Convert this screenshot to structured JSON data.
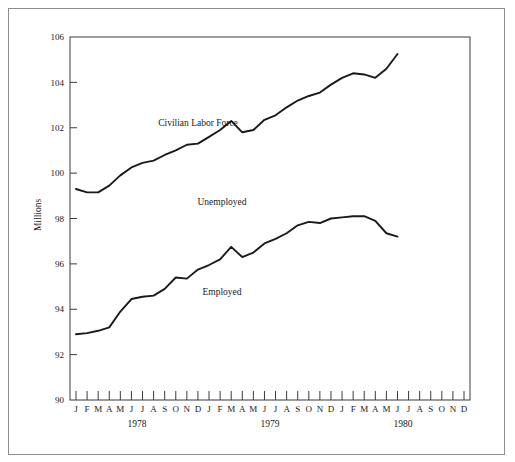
{
  "chart_data": {
    "type": "line",
    "title": "",
    "xlabel": "",
    "ylabel": "Millions",
    "ylim": [
      90,
      106
    ],
    "yticks": [
      90,
      92,
      94,
      96,
      98,
      100,
      102,
      104,
      106
    ],
    "grid": false,
    "legend_position": "inline-annotations",
    "x": [
      "J",
      "F",
      "M",
      "A",
      "M",
      "J",
      "J",
      "A",
      "S",
      "O",
      "N",
      "D",
      "J",
      "F",
      "M",
      "A",
      "M",
      "J",
      "J",
      "A",
      "S",
      "O",
      "N",
      "D",
      "J",
      "F",
      "M",
      "A",
      "M",
      "J",
      "J",
      "A",
      "S",
      "O",
      "N",
      "D"
    ],
    "year_labels": [
      "1978",
      "1979",
      "1980"
    ],
    "annotations": [
      "Civilian Labor Force",
      "Unemployed",
      "Employed"
    ],
    "series": [
      {
        "name": "Civilian Labor Force",
        "values": [
          99.3,
          99.15,
          99.15,
          99.45,
          99.9,
          100.25,
          100.45,
          100.55,
          100.8,
          101.0,
          101.25,
          101.3,
          101.6,
          101.9,
          102.3,
          101.8,
          101.9,
          102.35,
          102.55,
          102.9,
          103.2,
          103.4,
          103.55,
          103.9,
          104.2,
          104.4,
          104.35,
          104.2,
          104.6,
          105.25,
          null,
          null,
          null,
          null,
          null,
          null
        ]
      },
      {
        "name": "Employed",
        "values": [
          92.9,
          92.95,
          93.05,
          93.2,
          93.9,
          94.45,
          94.55,
          94.6,
          94.9,
          95.4,
          95.35,
          95.75,
          95.95,
          96.2,
          96.75,
          96.3,
          96.5,
          96.9,
          97.1,
          97.35,
          97.7,
          97.85,
          97.8,
          98.0,
          98.05,
          98.1,
          98.1,
          97.9,
          97.35,
          97.2,
          null,
          null,
          null,
          null,
          null,
          null
        ]
      }
    ]
  },
  "axis": {
    "y_title": "Millions",
    "y_tick_labels": [
      "106",
      "104",
      "102",
      "100",
      "98",
      "96",
      "94",
      "92",
      "90"
    ],
    "x_month_labels": [
      "J",
      "F",
      "M",
      "A",
      "M",
      "J",
      "J",
      "A",
      "S",
      "O",
      "N",
      "D",
      "J",
      "F",
      "M",
      "A",
      "M",
      "J",
      "J",
      "A",
      "S",
      "O",
      "N",
      "D",
      "J",
      "F",
      "M",
      "A",
      "M",
      "J",
      "J",
      "A",
      "S",
      "O",
      "N",
      "D"
    ],
    "x_year_labels": [
      "1978",
      "1979",
      "1980"
    ]
  },
  "annotations": {
    "civilian_labor_force": "Civilian Labor Force",
    "unemployed": "Unemployed",
    "employed": "Employed"
  },
  "colors": {
    "line": "#1a1a1a",
    "frame": "#8d8d8d",
    "axis": "#3a3a3a",
    "background": "#ffffff"
  }
}
